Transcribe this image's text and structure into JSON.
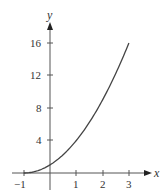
{
  "chart_data": {
    "type": "line",
    "title": "",
    "xlabel": "x",
    "ylabel": "y",
    "xlim": [
      -1.3,
      3.8
    ],
    "ylim": [
      0,
      18
    ],
    "grid": false,
    "legend": null,
    "x_ticks": [
      "−1",
      "1",
      "2",
      "3"
    ],
    "y_ticks": [
      "4",
      "8",
      "12",
      "16"
    ],
    "series": [
      {
        "name": "y = (x+1)^2",
        "x": [
          -1,
          -0.5,
          0,
          0.5,
          1,
          1.5,
          2,
          2.5,
          3
        ],
        "y": [
          0,
          0.25,
          1,
          2.25,
          4,
          6.25,
          9,
          12.25,
          16
        ]
      }
    ]
  },
  "axes": {
    "x_label": "x",
    "y_label": "y",
    "x_tick_labels": [
      "−1",
      "1",
      "2",
      "3"
    ],
    "y_tick_labels": [
      "4",
      "8",
      "12",
      "16"
    ]
  },
  "colors": {
    "curve": "#444444",
    "axis": "#555555",
    "text": "#333333"
  }
}
